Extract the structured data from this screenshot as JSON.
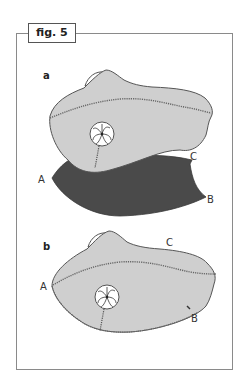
{
  "figure": {
    "label": "fig. 5",
    "colors": {
      "body_fill": "#cfcfcf",
      "outline": "#555555",
      "flap_fill": "#4a4a4a",
      "seam": "#666666",
      "frame": "#8a8a8a"
    },
    "panels": [
      {
        "id": "a",
        "label": "a",
        "point_labels": {
          "A": "A",
          "B": "B",
          "C": "C"
        }
      },
      {
        "id": "b",
        "label": "b",
        "point_labels": {
          "A": "A",
          "B": "B",
          "C": "C"
        }
      }
    ]
  }
}
